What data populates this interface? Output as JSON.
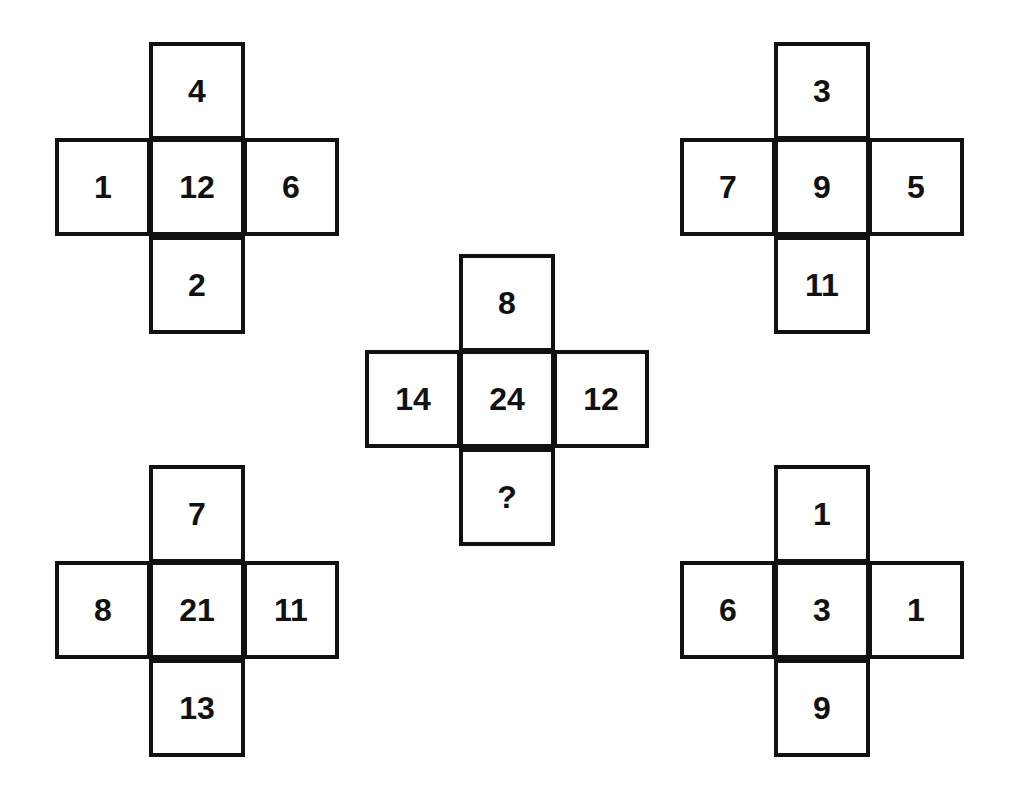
{
  "puzzle": {
    "crosses": [
      {
        "position": "top-left",
        "top": "4",
        "left": "1",
        "center": "12",
        "right": "6",
        "bottom": "2"
      },
      {
        "position": "top-right",
        "top": "3",
        "left": "7",
        "center": "9",
        "right": "5",
        "bottom": "11"
      },
      {
        "position": "middle",
        "top": "8",
        "left": "14",
        "center": "24",
        "right": "12",
        "bottom": "?"
      },
      {
        "position": "bottom-left",
        "top": "7",
        "left": "8",
        "center": "21",
        "right": "11",
        "bottom": "13"
      },
      {
        "position": "bottom-right",
        "top": "1",
        "left": "6",
        "center": "3",
        "right": "1",
        "bottom": "9"
      }
    ]
  }
}
